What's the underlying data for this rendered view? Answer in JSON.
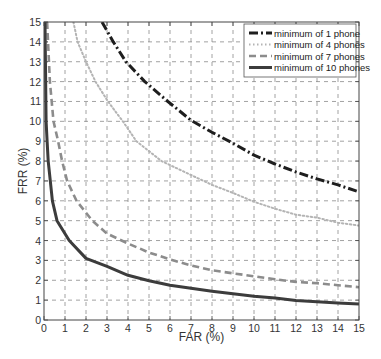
{
  "chart_data": {
    "type": "line",
    "title": "",
    "xlabel": "FAR (%)",
    "ylabel": "FRR (%)",
    "xlim": [
      0,
      15
    ],
    "ylim": [
      0,
      15
    ],
    "xticks": [
      0,
      1,
      2,
      3,
      4,
      5,
      6,
      7,
      8,
      9,
      10,
      11,
      12,
      13,
      14,
      15
    ],
    "yticks": [
      0,
      1,
      2,
      3,
      4,
      5,
      6,
      7,
      8,
      9,
      10,
      11,
      12,
      13,
      14,
      15
    ],
    "grid": true,
    "grid_style": "dashed",
    "legend_position": "upper right",
    "series": [
      {
        "name": "minimum of 1 phone",
        "style": "dash-dot",
        "color": "#1e1e1e",
        "width": 3,
        "points": [
          [
            2.76,
            15
          ],
          [
            3.3,
            14
          ],
          [
            3.9,
            13
          ],
          [
            4.8,
            12
          ],
          [
            5.9,
            11
          ],
          [
            7.0,
            10.05
          ],
          [
            8,
            9.45
          ],
          [
            9,
            8.9
          ],
          [
            10,
            8.3
          ],
          [
            11,
            7.85
          ],
          [
            12,
            7.45
          ],
          [
            13,
            7.1
          ],
          [
            14,
            6.8
          ],
          [
            15,
            6.45
          ]
        ]
      },
      {
        "name": "minimum of 4 phones",
        "style": "dotted",
        "color": "#b4b4b4",
        "width": 2,
        "points": [
          [
            1.4,
            15
          ],
          [
            1.6,
            14
          ],
          [
            2.0,
            13
          ],
          [
            2.45,
            12
          ],
          [
            3.05,
            11
          ],
          [
            3.75,
            10
          ],
          [
            4.4,
            9
          ],
          [
            5.6,
            8
          ],
          [
            7,
            7.3
          ],
          [
            8,
            6.8
          ],
          [
            9,
            6.4
          ],
          [
            10,
            5.95
          ],
          [
            11,
            5.6
          ],
          [
            12,
            5.3
          ],
          [
            13,
            5.15
          ],
          [
            14,
            4.9
          ],
          [
            15,
            4.75
          ]
        ]
      },
      {
        "name": "minimum of 7 phones",
        "style": "dashed",
        "color": "#8c8c8c",
        "width": 2.6,
        "points": [
          [
            0.15,
            15
          ],
          [
            0.28,
            12
          ],
          [
            0.45,
            10
          ],
          [
            0.67,
            9
          ],
          [
            0.86,
            8
          ],
          [
            1.1,
            7
          ],
          [
            1.55,
            6
          ],
          [
            2.3,
            5
          ],
          [
            3,
            4.35
          ],
          [
            4,
            3.85
          ],
          [
            5,
            3.4
          ],
          [
            6,
            3.05
          ],
          [
            7,
            2.75
          ],
          [
            8,
            2.5
          ],
          [
            9,
            2.35
          ],
          [
            10,
            2.2
          ],
          [
            11,
            2.05
          ],
          [
            12,
            1.92
          ],
          [
            13,
            1.85
          ],
          [
            14,
            1.75
          ],
          [
            15,
            1.65
          ]
        ]
      },
      {
        "name": "minimum of 10 phones",
        "style": "solid",
        "color": "#3c3c3c",
        "width": 3,
        "points": [
          [
            0.05,
            15
          ],
          [
            0.1,
            10
          ],
          [
            0.15,
            9
          ],
          [
            0.2,
            8
          ],
          [
            0.3,
            7
          ],
          [
            0.4,
            6
          ],
          [
            0.62,
            5
          ],
          [
            1.2,
            4
          ],
          [
            2.0,
            3.1
          ],
          [
            3,
            2.7
          ],
          [
            4,
            2.25
          ],
          [
            5,
            1.98
          ],
          [
            6,
            1.75
          ],
          [
            7,
            1.6
          ],
          [
            8,
            1.45
          ],
          [
            9,
            1.32
          ],
          [
            10,
            1.2
          ],
          [
            11,
            1.1
          ],
          [
            12,
            0.98
          ],
          [
            13,
            0.92
          ],
          [
            14,
            0.85
          ],
          [
            15,
            0.8
          ]
        ]
      }
    ]
  },
  "legend": {
    "items": [
      {
        "label": "minimum of 1 phone"
      },
      {
        "label": "minimum of 4 phones"
      },
      {
        "label": "minimum of 7 phones"
      },
      {
        "label": "minimum of 10 phones"
      }
    ]
  },
  "axes": {
    "xlabel": "FAR (%)",
    "ylabel": "FRR (%)"
  }
}
